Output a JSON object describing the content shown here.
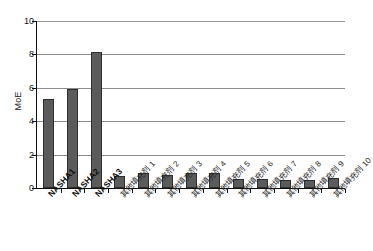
{
  "chart_data": {
    "type": "bar",
    "title": "",
    "xlabel": "",
    "ylabel": "MoE",
    "ylim": [
      0,
      10
    ],
    "yticks": [
      0,
      2,
      4,
      6,
      8,
      10
    ],
    "ytick_labels": [
      "0",
      "2",
      "4",
      "6",
      "8",
      "10"
    ],
    "grid": true,
    "legend": "none",
    "bar_color": "#5b5b5b",
    "bar_border_color": "#2e2e2e",
    "gridline_color": "#8c8c8c",
    "axis_color": "#111111",
    "categories": [
      "NASHA1",
      "NASHA2",
      "NASHA3",
      "其他填充剂 1",
      "其他填充剂 2",
      "其他填充剂 3",
      "其他填充剂 4",
      "其他填充剂 5",
      "其他填充剂 6",
      "其他填充剂 7",
      "其他填充剂 8",
      "其他填充剂 9",
      "其他填充剂 10"
    ],
    "category_styles": [
      "bold",
      "bold",
      "bold",
      "normal",
      "normal",
      "normal",
      "normal",
      "normal",
      "normal",
      "normal",
      "normal",
      "normal",
      "normal"
    ],
    "values": [
      5.35,
      5.9,
      8.15,
      0.72,
      0.87,
      0.8,
      0.87,
      0.88,
      0.52,
      0.55,
      0.5,
      0.5,
      0.6
    ]
  }
}
